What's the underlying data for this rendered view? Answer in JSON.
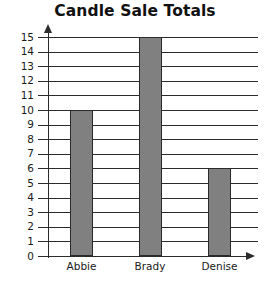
{
  "chart_data": {
    "type": "bar",
    "title": "Candle Sale Totals",
    "categories": [
      "Abbie",
      "Brady",
      "Denise"
    ],
    "values": [
      10,
      15,
      6
    ],
    "xlabel": "",
    "ylabel": "",
    "ylim": [
      0,
      15
    ],
    "ytick_labels": [
      "15",
      "14",
      "13",
      "12",
      "11",
      "10",
      "9",
      "8",
      "7",
      "6",
      "5",
      "4",
      "3",
      "2",
      "1",
      "0"
    ],
    "ytick_values": [
      15,
      14,
      13,
      12,
      11,
      10,
      9,
      8,
      7,
      6,
      5,
      4,
      3,
      2,
      1,
      0
    ],
    "grid": true,
    "legend": false,
    "bar_color": "#808080",
    "bar_outline_color": "#2b2b2b",
    "axis_color": "#2b2b2b",
    "background_color": "#ffffff"
  }
}
